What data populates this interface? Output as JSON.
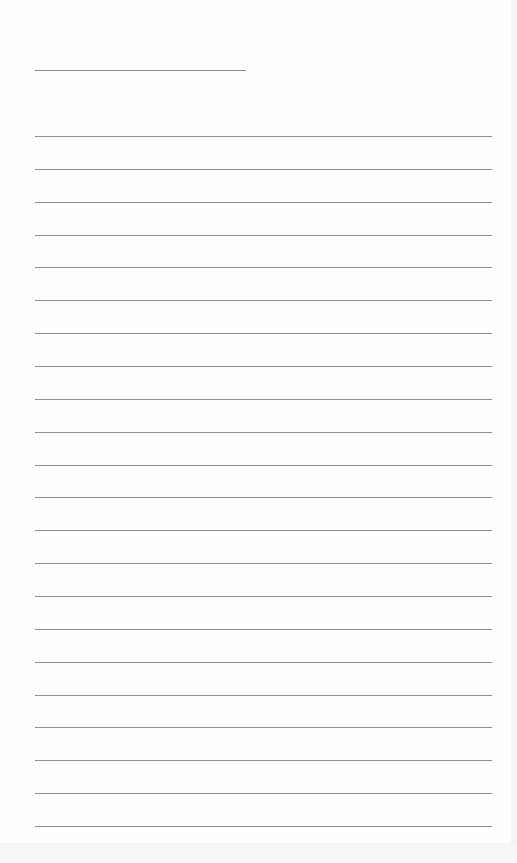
{
  "document": {
    "type": "lined-paper",
    "title_line": {
      "x": 35,
      "y": 70,
      "width": 211
    },
    "rules": {
      "count": 22,
      "start_y": 136,
      "spacing": 32.86,
      "x": 35,
      "width": 457
    },
    "line_color": "#8f8f8f",
    "paper_color": "#fefefe"
  }
}
